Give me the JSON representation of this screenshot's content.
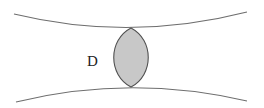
{
  "diagram": {
    "region_label": "D",
    "colors": {
      "background": "#ffffff",
      "curve_stroke": "#6e6e6e",
      "region_fill": "#c8c8c8",
      "region_stroke": "#505050",
      "label": "#222222"
    },
    "elements": [
      {
        "id": "upper-curve",
        "type": "curve",
        "description": "concave-up curve bounding top, closest to center at lens tip"
      },
      {
        "id": "lower-curve",
        "type": "curve",
        "description": "concave-down curve bounding bottom, closest to center at lens tip"
      },
      {
        "id": "region-D",
        "type": "shaded-lens",
        "description": "lens-shaped shaded region touching both curves"
      },
      {
        "id": "label-D",
        "type": "text",
        "text": "D"
      }
    ]
  }
}
